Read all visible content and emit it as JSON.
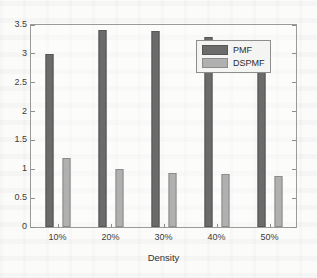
{
  "chart_data": {
    "type": "bar",
    "title": "",
    "subtitle": "",
    "xlabel": "Density",
    "ylabel": "",
    "categories": [
      "10%",
      "20%",
      "30%",
      "40%",
      "50%"
    ],
    "series": [
      {
        "name": "PMF",
        "color": "#6b6b6b",
        "values": [
          3.0,
          3.42,
          3.4,
          3.29,
          3.19
        ]
      },
      {
        "name": "DSPMF",
        "color": "#b0b0b0",
        "values": [
          1.2,
          1.01,
          0.93,
          0.92,
          0.89
        ]
      }
    ],
    "ylim": [
      0,
      3.5
    ],
    "yticks": [
      0,
      0.5,
      1,
      1.5,
      2,
      2.5,
      3,
      3.5
    ],
    "ytick_labels": [
      "0",
      "0.5",
      "1",
      "1.5",
      "2",
      "2.5",
      "3",
      "3.5"
    ],
    "grid": false,
    "legend_position": "top-right-inside",
    "legend_entries": [
      "PMF",
      "DSPMF"
    ],
    "annotations": []
  },
  "figure": {
    "background_color": "#fbfbfa",
    "axis_color": "#9a9a9a",
    "text_color": "#3b3b3b"
  }
}
